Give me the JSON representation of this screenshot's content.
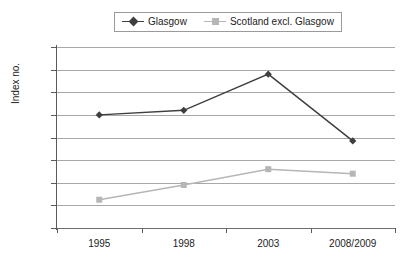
{
  "chart_data": {
    "type": "line",
    "title": "",
    "xlabel": "",
    "ylabel": "Index no.",
    "categories": [
      "1995",
      "1998",
      "2003",
      "2008/2009"
    ],
    "ylim": [
      80,
      160
    ],
    "yticks": [
      "80",
      "90",
      "100",
      "110",
      "120",
      "130",
      "140",
      "150",
      "160"
    ],
    "grid": true,
    "legend_position": "top-center",
    "series": [
      {
        "name": "Glasgow",
        "values": [
          130,
          132,
          148,
          118.5
        ],
        "color": "#3f3f3f",
        "marker": "diamond"
      },
      {
        "name": "Scotland excl. Glasgow",
        "values": [
          92.5,
          99,
          106,
          104
        ],
        "color": "#b6b6b6",
        "marker": "square"
      }
    ]
  },
  "legend": {
    "entries": [
      {
        "label": "Glasgow",
        "marker_icon": "diamond-marker-icon"
      },
      {
        "label": "Scotland excl. Glasgow",
        "marker_icon": "square-marker-icon"
      }
    ]
  },
  "axes": {
    "y_title": "Index no."
  },
  "colors": {
    "series_glasgow": "#3f3f3f",
    "series_scotland": "#b6b6b6",
    "gridline": "#a8a8a8",
    "axis": "#5a5a5a",
    "text": "#1c1c1c",
    "background": "#ffffff"
  }
}
